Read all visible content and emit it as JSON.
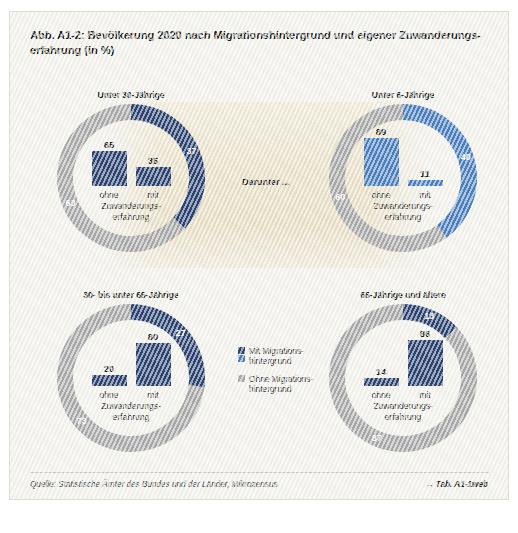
{
  "figure": {
    "label": "Abb. A1-2:",
    "title": "Bevölkerung 2020 nach Migrationshintergrund und eigener Zuwanderungs-erfahrung (in %)",
    "center_note": "Darunter ...",
    "source": "Quelle: Statistische Ämter des Bundes und der Länder, Mikrozensus",
    "table_ref": "→ Tab. A1-1web"
  },
  "colors": {
    "dark_blue": "#2c4372",
    "light_blue": "#4a7fbd",
    "gray": "#a8a8a8",
    "paper": "#f2f1ec",
    "beige": "#e8dfc6"
  },
  "legend": {
    "items": [
      {
        "label_line1": "Mit Migrations-",
        "label_line2": "hintergrund",
        "swatches": [
          "dark_blue",
          "light_blue"
        ]
      },
      {
        "label_line1": "Ohne Migrations-",
        "label_line2": "hintergrund",
        "swatches": [
          "gray"
        ]
      }
    ]
  },
  "axis_labels": {
    "cat_ohne": "ohne",
    "cat_mit": "mit",
    "sub_line1": "Zuwanderungs-",
    "sub_line2": "erfahrung"
  },
  "chart_data": [
    {
      "type": "pie",
      "id": "unter-30",
      "title": "Unter 30-Jährige",
      "categories": [
        "Mit Migrationshintergrund",
        "Ohne Migrationshintergrund"
      ],
      "values": [
        37,
        63
      ],
      "ring_color": "dark_blue",
      "inner": {
        "type": "bar",
        "categories": [
          "ohne",
          "mit"
        ],
        "values": [
          65,
          35
        ],
        "ylim": [
          0,
          100
        ],
        "bar_color": "dark_blue"
      }
    },
    {
      "type": "pie",
      "id": "unter-6",
      "title": "Unter 6-Jährige",
      "categories": [
        "Mit Migrationshintergrund",
        "Ohne Migrationshintergrund"
      ],
      "values": [
        40,
        60
      ],
      "ring_color": "light_blue",
      "inner": {
        "type": "bar",
        "categories": [
          "ohne",
          "mit"
        ],
        "values": [
          89,
          11
        ],
        "ylim": [
          0,
          100
        ],
        "bar_color": "light_blue"
      }
    },
    {
      "type": "pie",
      "id": "30-bis-65",
      "title": "30- bis unter 65-Jährige",
      "categories": [
        "Mit Migrationshintergrund",
        "Ohne Migrationshintergrund"
      ],
      "values": [
        27,
        73
      ],
      "ring_color": "dark_blue",
      "inner": {
        "type": "bar",
        "categories": [
          "ohne",
          "mit"
        ],
        "values": [
          20,
          80
        ],
        "ylim": [
          0,
          100
        ],
        "bar_color": "dark_blue"
      }
    },
    {
      "type": "pie",
      "id": "65-und-aelter",
      "title": "65-Jährige und ältere",
      "categories": [
        "Mit Migrationshintergrund",
        "Ohne Migrationshintergrund"
      ],
      "values": [
        13,
        87
      ],
      "ring_color": "dark_blue",
      "inner": {
        "type": "bar",
        "categories": [
          "ohne",
          "mit"
        ],
        "values": [
          14,
          86
        ],
        "ylim": [
          0,
          100
        ],
        "bar_color": "dark_blue"
      }
    }
  ]
}
